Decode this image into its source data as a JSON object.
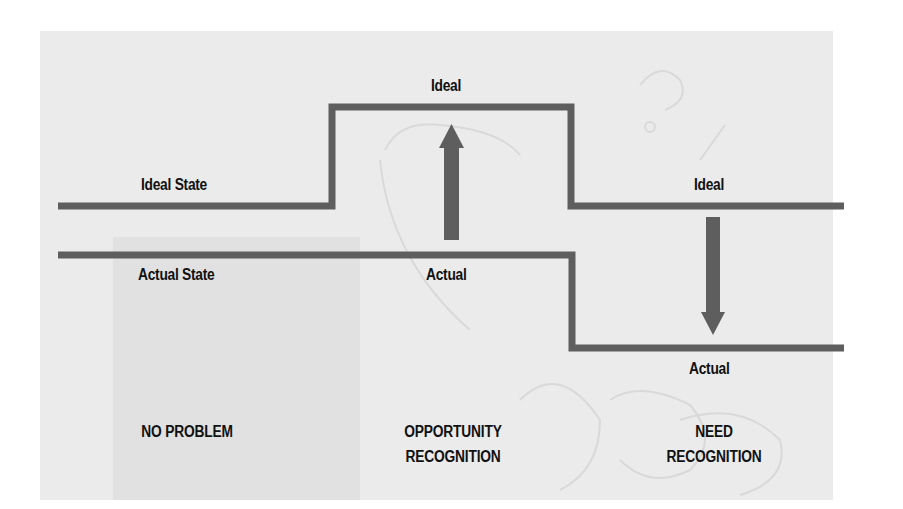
{
  "diagram": {
    "colors": {
      "line": "#5e5e5e",
      "panel_background": "#ebebeb",
      "text": "#111111"
    },
    "labels": {
      "ideal_state": "Ideal State",
      "actual_state": "Actual State",
      "middle_ideal": "Ideal",
      "middle_actual": "Actual",
      "right_ideal": "Ideal",
      "right_actual": "Actual"
    },
    "sections": [
      {
        "caption_line1": "NO PROBLEM",
        "caption_line2": ""
      },
      {
        "caption_line1": "OPPORTUNITY",
        "caption_line2": "RECOGNITION",
        "arrow": "up"
      },
      {
        "caption_line1": "NEED",
        "caption_line2": "RECOGNITION",
        "arrow": "down"
      }
    ]
  }
}
